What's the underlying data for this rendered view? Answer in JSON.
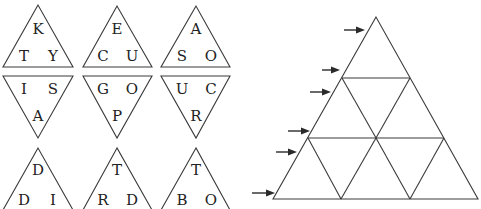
{
  "pieces": {
    "row1": [
      {
        "orientation": "up",
        "letters": {
          "top": "K",
          "left": "T",
          "right": "Y"
        }
      },
      {
        "orientation": "up",
        "letters": {
          "top": "E",
          "left": "C",
          "right": "U"
        }
      },
      {
        "orientation": "up",
        "letters": {
          "top": "A",
          "left": "S",
          "right": "O"
        }
      }
    ],
    "row2": [
      {
        "orientation": "down",
        "letters": {
          "left": "I",
          "right": "S",
          "bottom": "A"
        }
      },
      {
        "orientation": "down",
        "letters": {
          "left": "G",
          "right": "O",
          "bottom": "P"
        }
      },
      {
        "orientation": "down",
        "letters": {
          "left": "U",
          "right": "C",
          "bottom": "R"
        }
      }
    ],
    "row3": [
      {
        "orientation": "up",
        "letters": {
          "top": "D",
          "left": "D",
          "right": "I"
        }
      },
      {
        "orientation": "up",
        "letters": {
          "top": "T",
          "left": "R",
          "right": "D"
        }
      },
      {
        "orientation": "up",
        "letters": {
          "top": "T",
          "left": "B",
          "right": "O"
        }
      }
    ]
  },
  "board": {
    "rows": 3,
    "cells": 9,
    "arrow_count": 6
  },
  "colors": {
    "line": "#3a3a3a",
    "text": "#222222",
    "background": "#ffffff"
  }
}
